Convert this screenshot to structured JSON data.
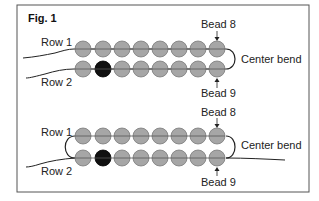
{
  "figure": {
    "title": "Fig. 1",
    "colors": {
      "bead": "#a6a6a6",
      "bead_outline": "#7a7a7a",
      "accent_bead": "#111111",
      "thread": "#222222",
      "frame": "#555555"
    },
    "beads_per_row": 8,
    "accent_bead_index_row2": 1,
    "panels": [
      {
        "row1_label": "Row 1",
        "row2_label": "Row 2",
        "top_callout": "Bead 8",
        "bottom_callout": "Bead 9",
        "side_label": "Center bend"
      },
      {
        "row1_label": "Row 1",
        "row2_label": "Row 2",
        "top_callout": "Bead 8",
        "bottom_callout": "Bead 9",
        "side_label": "Center bend"
      }
    ]
  }
}
